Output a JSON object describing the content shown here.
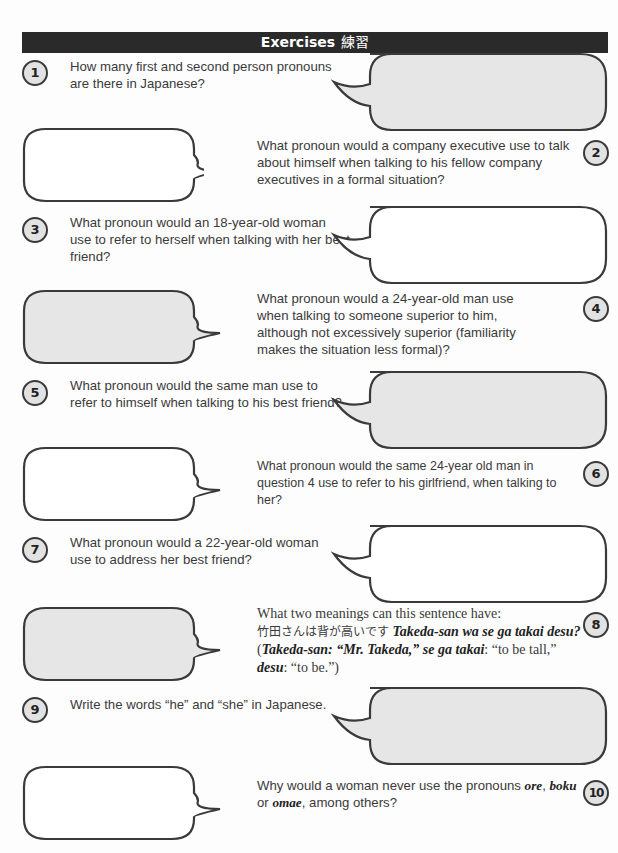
{
  "header": {
    "title": "Exercises",
    "title_jp": "練習"
  },
  "colors": {
    "header_bg": "#2a2a2a",
    "bubble_shaded": "#e6e6e6",
    "bubble_white": "#ffffff",
    "outline": "#3a3a3a"
  },
  "questions": [
    {
      "number": "1",
      "text": "How many first and second person pronouns are there in Japanese?",
      "bubble": "shaded"
    },
    {
      "number": "2",
      "text": "What pronoun would a company executive use to talk about himself when talking to his fellow company executives in a formal situation?",
      "bubble": "white"
    },
    {
      "number": "3",
      "text": "What pronoun would an 18-year-old woman use to refer to herself when talking with her best friend?",
      "bubble": "white"
    },
    {
      "number": "4",
      "text": "What pronoun would a 24-year-old man use when talking to someone superior to him, although not excessively superior (familiarity makes the situation less formal)?",
      "bubble": "shaded"
    },
    {
      "number": "5",
      "text": "What pronoun would the same man use to refer to himself when talking to his best friend?",
      "bubble": "shaded"
    },
    {
      "number": "6",
      "text": "What pronoun would the same 24-year old man in question 4 use to refer to his girlfriend, when talking to her?",
      "bubble": "white"
    },
    {
      "number": "7",
      "text": "What pronoun would a 22-year-old woman use to address her best friend?",
      "bubble": "white"
    },
    {
      "number": "8",
      "text_intro": "What two meanings can this sentence have:",
      "text_jp": "竹田さんは背が高いです",
      "text_romaji": "Takeda-san wa se ga takai desu?",
      "gloss_1_term": "Takeda-san: “Mr. Takeda,”",
      "gloss_2_term": "se ga takai",
      "gloss_2_def": ": “to be tall,”",
      "gloss_3_term": "desu",
      "gloss_3_def": ": “to be.”)",
      "bubble": "shaded"
    },
    {
      "number": "9",
      "text": "Write the words “he” and “she” in Japanese.",
      "bubble": "shaded"
    },
    {
      "number": "10",
      "text_intro": "Why would a woman never use the pronouns",
      "term_1": "ore",
      "term_2": "boku",
      "connector": "or",
      "term_3": "omae",
      "text_outro": ", among others?",
      "bubble": "white"
    }
  ]
}
